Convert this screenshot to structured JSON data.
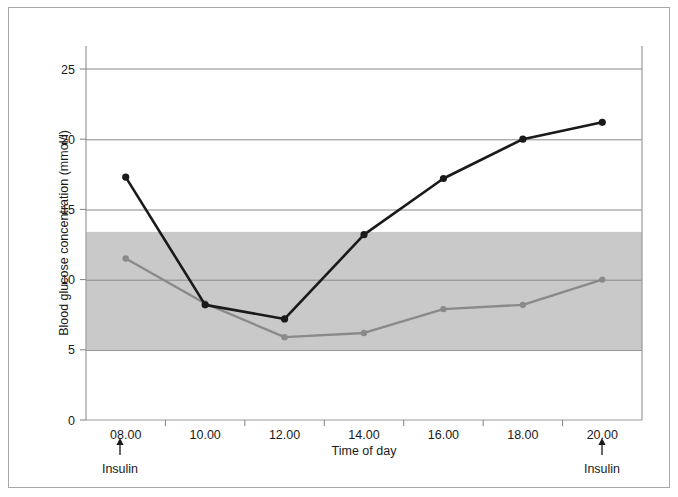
{
  "chart_data": {
    "type": "line",
    "title": "",
    "xlabel": "Time of day",
    "ylabel": "Blood glucose concentration (mmol/l)",
    "categories": [
      "08.00",
      "10.00",
      "12.00",
      "14.00",
      "16.00",
      "18.00",
      "20.00"
    ],
    "x_tick_labels": [
      "08.00",
      "10.00",
      "12.00",
      "14.00",
      "16.00",
      "18.00",
      "20.00"
    ],
    "y_tick_labels": [
      "0",
      "5",
      "10",
      "15",
      "20",
      "25"
    ],
    "y_ticks": [
      0,
      5,
      10,
      15,
      20,
      25
    ],
    "ylim": [
      0,
      27
    ],
    "grid": "horizontal",
    "legend": "none",
    "series": [
      {
        "name": "untreated",
        "color": "#1a1a1a",
        "marker": "circle",
        "values": [
          17.3,
          8.2,
          7.2,
          13.2,
          17.2,
          20.0,
          21.2
        ]
      },
      {
        "name": "treated",
        "color": "#8a8a8a",
        "marker": "circle",
        "values": [
          11.5,
          8.3,
          5.9,
          6.2,
          7.9,
          8.2,
          10.0
        ]
      }
    ],
    "shaded_band": {
      "label": "normal range",
      "color": "#c9c9c9",
      "y_from": 5.0,
      "y_to": 13.4
    },
    "annotations": [
      {
        "text": "Insulin",
        "at_category": "08.00",
        "arrow": "up"
      },
      {
        "text": "Insulin",
        "at_category": "20.00",
        "arrow": "up"
      }
    ]
  },
  "axes": {
    "x_title": "Time of day",
    "y_title": "Blood glucose concentration (mmol/l)"
  },
  "annotations": {
    "left_label": "Insulin",
    "right_label": "Insulin"
  },
  "colors": {
    "series_dark": "#1a1a1a",
    "series_light": "#8a8a8a",
    "band": "#c9c9c9",
    "grid": "#808080",
    "axis": "#9a9a9a",
    "frame": "#a8a8a8",
    "text": "#1a1a1a"
  }
}
